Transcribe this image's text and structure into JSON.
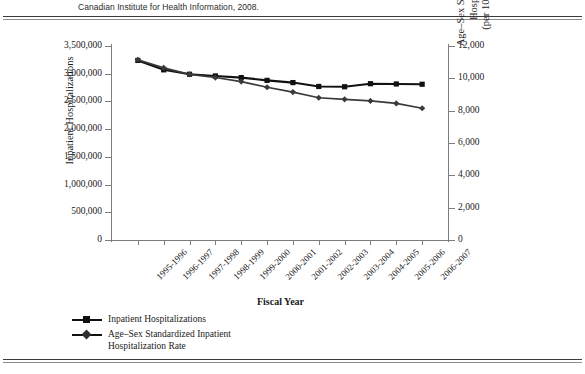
{
  "figure": {
    "caption": "Canadian Institute for Health Information, 2008."
  },
  "chart_data": {
    "type": "line",
    "title": "",
    "xlabel": "Fiscal Year",
    "grid": false,
    "legend_position": "below-left",
    "categories": [
      "1995-1996",
      "1996-1997",
      "1997-1998",
      "1998-1999",
      "1999-2000",
      "2000-2001",
      "2001-2002",
      "2002-2003",
      "2003-2004",
      "2004-2005",
      "2005-2006",
      "2006-2007"
    ],
    "axes": {
      "left": {
        "label": "Inpatient Hospitalizations",
        "ylim": [
          0,
          3500000
        ],
        "ticks": [
          0,
          500000,
          1000000,
          1500000,
          2000000,
          2500000,
          3000000,
          3500000
        ],
        "ticklabels": [
          "0",
          "500,000",
          "1,000,000",
          "1,500,000",
          "2,000,000",
          "2,500,000",
          "3,000,000",
          "3,500,000"
        ]
      },
      "right": {
        "label_lines": [
          "Age–Sex Standar dized Inpatient",
          "Hospitalization Rate",
          "(per 100,000 Population)"
        ],
        "ylim": [
          0,
          12000
        ],
        "ticks": [
          0,
          2000,
          4000,
          6000,
          8000,
          10000,
          12000
        ],
        "ticklabels": [
          "0",
          "2,000",
          "4,000",
          "6,000",
          "8,000",
          "10,000",
          "12,000"
        ]
      }
    },
    "series": [
      {
        "name": "Inpatient Hospitalizations",
        "axis": "left",
        "marker": "square",
        "color": "#111111",
        "values": [
          3240000,
          3070000,
          2990000,
          2960000,
          2930000,
          2880000,
          2840000,
          2770000,
          2765000,
          2820000,
          2815000,
          2810000
        ]
      },
      {
        "name": "Age–Sex Standardized Inpatient Hospitalization Rate",
        "axis": "right",
        "marker": "diamond",
        "color": "#3a3a3a",
        "values": [
          11150,
          10650,
          10250,
          10050,
          9800,
          9450,
          9150,
          8800,
          8700,
          8600,
          8450,
          8150
        ]
      }
    ]
  },
  "legend": {
    "items": [
      {
        "label": "Inpatient Hospitalizations",
        "marker": "square"
      },
      {
        "label": "Age–Sex Standardized Inpatient\nHospitalization Rate",
        "marker": "diamond"
      }
    ]
  },
  "colors": {
    "series_primary": "#111111",
    "series_secondary": "#3a3a3a",
    "axis": "#7d7d7d",
    "rule": "#3b3b3b",
    "background": "#ffffff"
  }
}
